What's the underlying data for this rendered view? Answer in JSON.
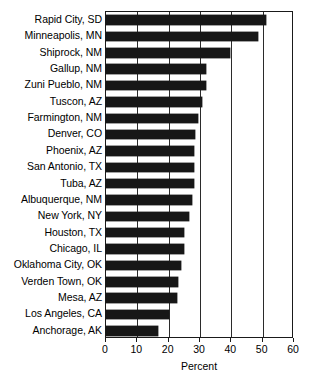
{
  "chart_data": {
    "type": "bar",
    "orientation": "horizontal",
    "title": "",
    "xlabel": "Percent",
    "ylabel": "",
    "xlim": [
      0,
      60
    ],
    "xticks": [
      0,
      10,
      20,
      30,
      40,
      50,
      60
    ],
    "grid": "vertical",
    "legend": "none",
    "bar_color": "#171717",
    "categories": [
      "Rapid City, SD",
      "Minneapolis, MN",
      "Shiprock, NM",
      "Gallup, NM",
      "Zuni Pueblo, NM",
      "Tuscon, AZ",
      "Farmington, NM",
      "Denver, CO",
      "Phoenix, AZ",
      "San Antonio, TX",
      "Tuba, AZ",
      "Albuquerque, NM",
      "New York, NY",
      "Houston, TX",
      "Chicago, IL",
      "Oklahoma City, OK",
      "Verden Town, OK",
      "Mesa, AZ",
      "Los Angeles, CA",
      "Anchorage, AK"
    ],
    "values": [
      51,
      48.5,
      39.5,
      32,
      32,
      30.5,
      29.5,
      28.5,
      28,
      28,
      28,
      27.5,
      26.5,
      25,
      25,
      24,
      23,
      22.5,
      20,
      16.5
    ]
  },
  "axis": {
    "tick_labels": [
      "0",
      "10",
      "20",
      "30",
      "40",
      "50",
      "60"
    ],
    "x_title": "Percent"
  },
  "caption": {
    "text": ""
  }
}
